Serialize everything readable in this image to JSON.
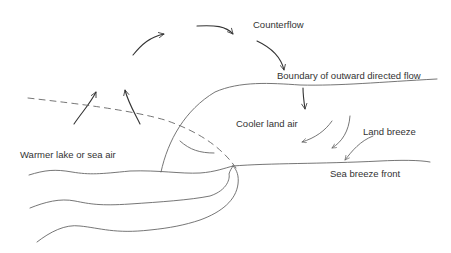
{
  "diagram": {
    "labels": {
      "counterflow": "Counterflow",
      "boundary": "Boundary of outward directed flow",
      "cooler_land_air": "Cooler land air",
      "land_breeze": "Land breeze",
      "warmer_air": "Warmer lake or sea air",
      "sea_breeze_front": "Sea breeze front"
    },
    "colors": {
      "line_dark": "#333333",
      "line_grey": "#666666",
      "text": "#333333",
      "background": "#ffffff"
    }
  }
}
